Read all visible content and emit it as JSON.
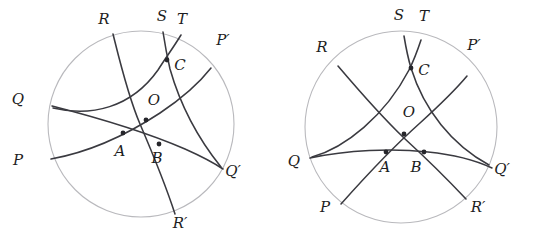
{
  "figure": {
    "panels": [
      {
        "name": "left-panel",
        "disk": {
          "cx": 141,
          "cy": 124,
          "r": 93
        },
        "boundary_labels": [
          {
            "id": "R",
            "text": "R",
            "x": 104,
            "y": 24
          },
          {
            "id": "S",
            "text": "S",
            "x": 162,
            "y": 21
          },
          {
            "id": "T",
            "text": "T",
            "x": 182,
            "y": 24
          },
          {
            "id": "Pp",
            "text": "P′",
            "x": 223,
            "y": 45
          },
          {
            "id": "Q",
            "text": "Q",
            "x": 18,
            "y": 104
          },
          {
            "id": "P",
            "text": "P",
            "x": 18,
            "y": 165
          },
          {
            "id": "Qp",
            "text": "Q′",
            "x": 233,
            "y": 176
          },
          {
            "id": "Rp",
            "text": "R′",
            "x": 180,
            "y": 228
          }
        ],
        "interior_labels": [
          {
            "id": "C",
            "text": "C",
            "x": 180,
            "y": 70
          },
          {
            "id": "O",
            "text": "O",
            "x": 154,
            "y": 105
          },
          {
            "id": "A",
            "text": "A",
            "x": 120,
            "y": 156
          },
          {
            "id": "B",
            "text": "B",
            "x": 157,
            "y": 163
          }
        ],
        "vertices": [
          {
            "id": "C",
            "x": 167,
            "y": 60
          },
          {
            "id": "O",
            "x": 146,
            "y": 120
          },
          {
            "id": "A",
            "x": 123,
            "y": 133
          },
          {
            "id": "B",
            "x": 159,
            "y": 144
          }
        ],
        "curves": [
          {
            "id": "curve-PP-prime",
            "from": "P",
            "to": "P′",
            "d": "M 51 159 C 90 152 128 134 160 113 C 184 97 200 82 211 68"
          },
          {
            "id": "curve-QQ-prime",
            "from": "Q",
            "to": "Q′",
            "d": "M 52 106 C 95 117 148 133 185 149 C 203 157 214 163 223 169"
          },
          {
            "id": "curve-RR-prime",
            "from": "R",
            "to": "R′",
            "d": "M 113 34 C 120 62 128 96 140 124 C 152 152 164 180 175 214"
          },
          {
            "id": "curve-S",
            "from": "S",
            "to": "Q′",
            "d": "M 163 32 C 165 45 167 56 170 69 C 180 104 196 136 221 167"
          },
          {
            "id": "curve-T",
            "from": "T",
            "to": "Q",
            "d": "M 181 35 C 173 48 167 56 158 70 C 131 108 91 117 53 108"
          }
        ]
      },
      {
        "name": "right-panel",
        "disk": {
          "cx": 401,
          "cy": 127,
          "r": 96
        },
        "boundary_labels": [
          {
            "id": "S",
            "text": "S",
            "x": 399,
            "y": 20
          },
          {
            "id": "T",
            "text": "T",
            "x": 424,
            "y": 21
          },
          {
            "id": "R",
            "text": "R",
            "x": 322,
            "y": 52
          },
          {
            "id": "Pp",
            "text": "P′",
            "x": 474,
            "y": 50
          },
          {
            "id": "Q",
            "text": "Q",
            "x": 294,
            "y": 166
          },
          {
            "id": "Qp",
            "text": "Q′",
            "x": 502,
            "y": 174
          },
          {
            "id": "P",
            "text": "P",
            "x": 325,
            "y": 212
          },
          {
            "id": "Rp",
            "text": "R′",
            "x": 478,
            "y": 212
          }
        ],
        "interior_labels": [
          {
            "id": "C",
            "text": "C",
            "x": 424,
            "y": 75
          },
          {
            "id": "O",
            "text": "O",
            "x": 409,
            "y": 117
          },
          {
            "id": "A",
            "text": "A",
            "x": 385,
            "y": 172
          },
          {
            "id": "B",
            "text": "B",
            "x": 416,
            "y": 172
          }
        ],
        "vertices": [
          {
            "id": "C",
            "x": 411,
            "y": 68
          },
          {
            "id": "O",
            "x": 404,
            "y": 134
          },
          {
            "id": "A",
            "x": 386,
            "y": 152
          },
          {
            "id": "B",
            "x": 424,
            "y": 152
          }
        ],
        "curves": [
          {
            "id": "curve-PP-prime",
            "from": "P",
            "to": "P′",
            "d": "M 341 204 C 365 177 392 148 420 123 C 442 103 457 88 467 76"
          },
          {
            "id": "curve-RR-prime",
            "from": "R",
            "to": "R′",
            "d": "M 338 66 C 355 86 380 115 404 138 C 428 160 450 182 466 199"
          },
          {
            "id": "curve-QQ-prime",
            "from": "Q",
            "to": "Q′",
            "d": "M 310 158 C 347 150 392 148 428 152 C 458 155 477 161 492 168"
          },
          {
            "id": "curve-S",
            "from": "S",
            "to": "Q′",
            "d": "M 404 36 C 406 48 408 58 411 68 C 424 110 452 145 489 165"
          },
          {
            "id": "curve-T",
            "from": "T",
            "to": "Q",
            "d": "M 421 40 C 417 52 414 60 409 70 C 385 116 345 148 312 157"
          }
        ]
      }
    ]
  }
}
